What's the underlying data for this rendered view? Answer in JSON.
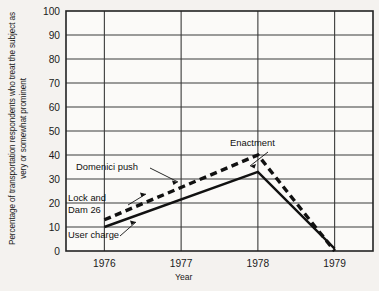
{
  "chart_data": {
    "type": "line",
    "title": "",
    "xlabel": "Year",
    "ylabel": "Percentage of transportation respondents who treat the subject as very or somewhat prominent",
    "x": [
      1976,
      1977,
      1978,
      1979
    ],
    "xlim": [
      1975.5,
      1979.5
    ],
    "ylim": [
      0,
      100
    ],
    "yticks": [
      0,
      10,
      20,
      30,
      40,
      50,
      60,
      70,
      80,
      90,
      100
    ],
    "xticks": [
      "1976",
      "1977",
      "1978",
      "1979"
    ],
    "grid": true,
    "legend_position": "none",
    "series": [
      {
        "name": "Domenici push",
        "style": "dashed",
        "x": [
          1976,
          1978,
          1979
        ],
        "values": [
          13,
          40,
          0
        ]
      },
      {
        "name": "User charge",
        "style": "solid",
        "x": [
          1976,
          1978,
          1979
        ],
        "values": [
          10,
          33,
          1
        ]
      }
    ],
    "annotations": [
      {
        "text": "Domenici push",
        "x": 1976.6,
        "y": 45
      },
      {
        "text": "Lock and",
        "x": 1975.8,
        "y": 24
      },
      {
        "text": "Dam 26",
        "x": 1975.8,
        "y": 19
      },
      {
        "text": "User charge",
        "x": 1975.8,
        "y": 7
      },
      {
        "text": "Enactment",
        "x": 1977.7,
        "y": 49
      }
    ]
  },
  "axes": {
    "ylabel_text": "Percentage of transportation respondents who treat the subject as very or somewhat prominent",
    "xlabel_text": "Year"
  },
  "labels": {
    "domenici": "Domenici push",
    "lock_and": "Lock and",
    "dam26": "Dam 26",
    "user_charge": "User charge",
    "enactment": "Enactment"
  },
  "colors": {
    "background": "#f4f2ef",
    "grid": "#3a3a3a",
    "line": "#111111",
    "text": "#1a1a1a"
  }
}
